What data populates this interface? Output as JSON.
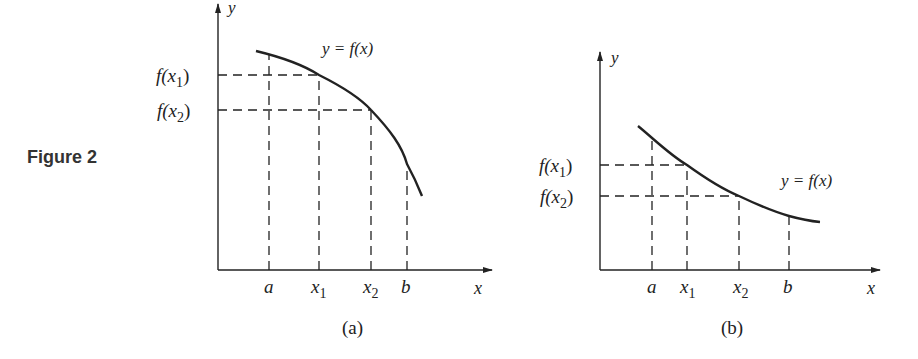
{
  "figure_label": "Figure 2",
  "panels": [
    {
      "caption": "(a)",
      "curve_label": "y = f(x)",
      "axis_x": "x",
      "axis_y": "y",
      "y_ticks": {
        "fx1": "f(x",
        "fx1_sub": "1",
        "fx2": "f(x",
        "fx2_sub": "2"
      },
      "x_ticks": {
        "a": "a",
        "x1": "x",
        "x1_sub": "1",
        "x2": "x",
        "x2_sub": "2",
        "b": "b"
      },
      "description": "decreasing, concave down"
    },
    {
      "caption": "(b)",
      "curve_label": "y = f(x)",
      "axis_x": "x",
      "axis_y": "y",
      "y_ticks": {
        "fx1": "f(x",
        "fx1_sub": "1",
        "fx2": "f(x",
        "fx2_sub": "2"
      },
      "x_ticks": {
        "a": "a",
        "x1": "x",
        "x1_sub": "1",
        "x2": "x",
        "x2_sub": "2",
        "b": "b"
      },
      "description": "decreasing, concave up"
    }
  ],
  "colors": {
    "ink": "#222222",
    "label": "#333333"
  }
}
